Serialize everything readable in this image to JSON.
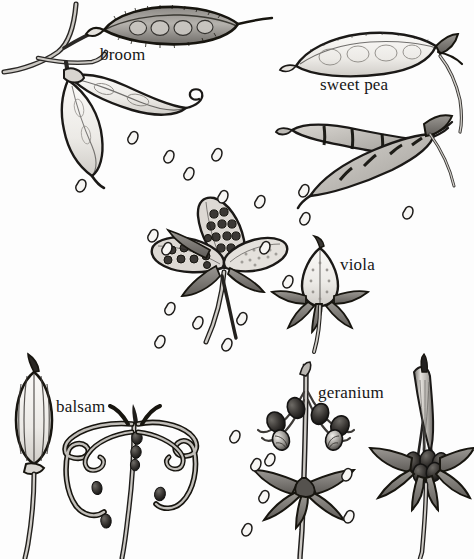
{
  "figure": {
    "kind": "botanical-illustration",
    "title_visible": false,
    "background_color": "#fdfdfd",
    "ink_color": "#1a1a1a",
    "fill_light": "#e8e6e2",
    "fill_mid": "#b9b6b1",
    "fill_dark": "#6e6b67",
    "fill_seed": "#151515"
  },
  "labels": [
    {
      "id": "broom",
      "text": "broom"
    },
    {
      "id": "sweetpea",
      "text": "sweet pea"
    },
    {
      "id": "viola",
      "text": "viola"
    },
    {
      "id": "balsam",
      "text": "balsam"
    },
    {
      "id": "geranium",
      "text": "geranium"
    }
  ],
  "specimens": [
    {
      "name": "broom",
      "label": "broom",
      "region": "top-left",
      "parts": [
        "branched stem",
        "intact dark hairy pod with visible seeds",
        "dehisced pod valve, twisted, pale",
        "second twisted valve hanging down",
        "scattered seeds"
      ]
    },
    {
      "name": "sweet pea",
      "label": "sweet pea",
      "region": "top-right",
      "parts": [
        "intact pale pod with seed outlines",
        "two dehisced coiled valves with dark constrictions",
        "calyx and pedicel",
        "scattered seeds"
      ]
    },
    {
      "name": "viola",
      "label": "viola",
      "region": "middle",
      "parts": [
        "open three-valved capsule with round seeds",
        "closed capsule with sepals",
        "stalks",
        "scattered seeds"
      ]
    },
    {
      "name": "balsam",
      "label": "balsam",
      "region": "bottom-left",
      "parts": [
        "intact ribbed spindle capsule on stalk",
        "explosively coiled valves",
        "dark ejected seeds"
      ]
    },
    {
      "name": "geranium",
      "label": "geranium",
      "region": "bottom-right",
      "parts": [
        "central beak column with recurved awns carrying seeds",
        "reflexed sepals",
        "unopened beak with seeds at base",
        "scattered seeds"
      ]
    }
  ],
  "scattered_seeds_count": 24
}
